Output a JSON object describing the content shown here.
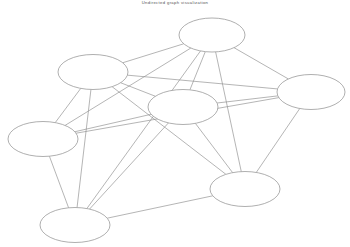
{
  "figure": {
    "title": "Undirected graph visualization",
    "width": 350,
    "height": 247,
    "background_color": "#ffffff"
  },
  "style": {
    "node_fill": "#ffffff",
    "node_stroke": "#8d8d8d",
    "edge_stroke": "#8d8d8d",
    "node_rx": 35,
    "node_ry": 17.5
  },
  "chart_data": {
    "type": "diagram",
    "subtype": "node-link-graph",
    "title": "Undirected graph visualization",
    "directed": false,
    "node_count": 7,
    "edge_count": 18,
    "node_shape": "ellipse",
    "nodes": [
      {
        "id": "n1",
        "label": "",
        "x": 212,
        "y": 35,
        "rx": 33,
        "ry": 17
      },
      {
        "id": "n2",
        "label": "",
        "x": 93,
        "y": 72,
        "rx": 35,
        "ry": 17.5
      },
      {
        "id": "n3",
        "label": "",
        "x": 311,
        "y": 92,
        "rx": 34,
        "ry": 17.5
      },
      {
        "id": "n4",
        "label": "",
        "x": 183,
        "y": 107,
        "rx": 35,
        "ry": 17.5
      },
      {
        "id": "n5",
        "label": "",
        "x": 43,
        "y": 139,
        "rx": 35,
        "ry": 17.5
      },
      {
        "id": "n6",
        "label": "",
        "x": 245,
        "y": 189,
        "rx": 35,
        "ry": 17.5
      },
      {
        "id": "n7",
        "label": "",
        "x": 75,
        "y": 225,
        "rx": 35,
        "ry": 17.5
      }
    ],
    "edges": [
      {
        "source": "n1",
        "target": "n2"
      },
      {
        "source": "n1",
        "target": "n3"
      },
      {
        "source": "n1",
        "target": "n4"
      },
      {
        "source": "n1",
        "target": "n5"
      },
      {
        "source": "n1",
        "target": "n6"
      },
      {
        "source": "n1",
        "target": "n7"
      },
      {
        "source": "n2",
        "target": "n3"
      },
      {
        "source": "n2",
        "target": "n4"
      },
      {
        "source": "n2",
        "target": "n5"
      },
      {
        "source": "n2",
        "target": "n6"
      },
      {
        "source": "n2",
        "target": "n7"
      },
      {
        "source": "n3",
        "target": "n4"
      },
      {
        "source": "n3",
        "target": "n5"
      },
      {
        "source": "n3",
        "target": "n6"
      },
      {
        "source": "n4",
        "target": "n5"
      },
      {
        "source": "n4",
        "target": "n6"
      },
      {
        "source": "n4",
        "target": "n7"
      },
      {
        "source": "n5",
        "target": "n7"
      },
      {
        "source": "n6",
        "target": "n7"
      }
    ]
  }
}
